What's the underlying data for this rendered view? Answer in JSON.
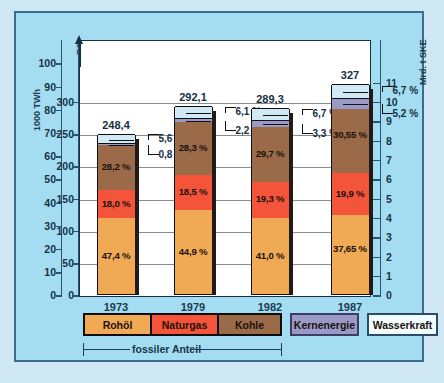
{
  "axes": {
    "left_outer_caption": "1000 TWh",
    "left_inner_caption": "EJ",
    "right_caption": "Mrd. t SKE",
    "left_outer_ticks": [
      "100",
      "90",
      "80",
      "70",
      "60",
      "50",
      "40",
      "30",
      "20",
      "10",
      "0"
    ],
    "left_inner_ticks": [
      "300",
      "250",
      "200",
      "150",
      "100",
      "50",
      "0"
    ],
    "right_ticks": [
      "11",
      "10",
      "9",
      "8",
      "7",
      "6",
      "5",
      "4",
      "3",
      "2",
      "1",
      "0"
    ]
  },
  "legend": {
    "fossil": [
      {
        "label": "Rohöl",
        "color": "#f0a955"
      },
      {
        "label": "Naturgas",
        "color": "#f4553a"
      },
      {
        "label": "Kohle",
        "color": "#9a6a49"
      }
    ],
    "nuclear": {
      "label": "Kernenergie",
      "color": "#9a9ac8"
    },
    "hydro": {
      "label": "Wasserkraft",
      "color": "#cfeaf4"
    },
    "fossil_bracket_label": "fossiler Anteil"
  },
  "chart_data": {
    "type": "bar",
    "title": "",
    "subtitle": "",
    "stacked": true,
    "xlabel": "",
    "ylabel": "EJ",
    "grid": true,
    "legend_position": "bottom",
    "categories": [
      "1973",
      "1979",
      "1982",
      "1987"
    ],
    "totals_ej": [
      248.4,
      292.1,
      289.3,
      327
    ],
    "total_labels": [
      "248,4",
      "292,1",
      "289,3",
      "327"
    ],
    "axis_left_outer": {
      "label": "1000 TWh",
      "min": 0,
      "max": 100,
      "step": 10
    },
    "axis_left_inner": {
      "label": "EJ",
      "min": 0,
      "max": 300,
      "step": 50
    },
    "axis_right": {
      "label": "Mrd. t SKE",
      "min": 0,
      "max": 11,
      "step": 1
    },
    "series": [
      {
        "name": "Rohöl",
        "color": "#f0a955",
        "percent_labels": [
          "47,4 %",
          "44,9 %",
          "41,0 %",
          "37,65 %"
        ],
        "percents": [
          47.4,
          44.9,
          41.0,
          37.65
        ],
        "inside": [
          true,
          true,
          true,
          true
        ]
      },
      {
        "name": "Naturgas",
        "color": "#f4553a",
        "percent_labels": [
          "18,0 %",
          "18,5 %",
          "19,3 %",
          "19,9 %"
        ],
        "percents": [
          18.0,
          18.5,
          19.3,
          19.9
        ],
        "inside": [
          true,
          true,
          true,
          true
        ]
      },
      {
        "name": "Kohle",
        "color": "#9a6a49",
        "percent_labels": [
          "28,2 %",
          "28,3 %",
          "29,7 %",
          "30,55 %"
        ],
        "percents": [
          28.2,
          28.3,
          29.7,
          30.55
        ],
        "inside": [
          true,
          true,
          true,
          true
        ]
      },
      {
        "name": "Kernenergie",
        "color": "#9a9ac8",
        "percent_labels": [
          "0,8 %",
          "2,2 %",
          "3,3 %",
          "5,2 %"
        ],
        "percents": [
          0.8,
          2.2,
          3.3,
          5.2
        ],
        "inside": [
          false,
          false,
          false,
          false
        ]
      },
      {
        "name": "Wasserkraft",
        "color": "#cfeaf4",
        "percent_labels": [
          "5,6 %",
          "6,1 %",
          "6,7 %",
          "6,7 %"
        ],
        "percents": [
          5.6,
          6.1,
          6.7,
          6.7
        ],
        "inside": [
          false,
          false,
          false,
          false
        ]
      }
    ]
  }
}
